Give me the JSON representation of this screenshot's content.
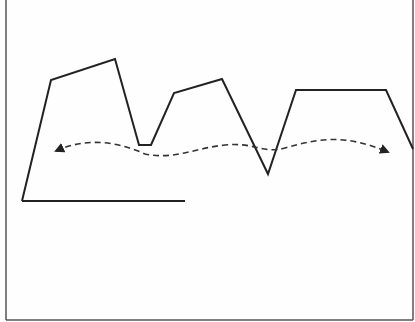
{
  "diagram": {
    "frame": {
      "stroke": "#555555"
    },
    "solid_line": {
      "stroke": "#222222",
      "points": [
        [
          22,
          201
        ],
        [
          51,
          80
        ],
        [
          115,
          59
        ],
        [
          139,
          145
        ],
        [
          151,
          145
        ],
        [
          174,
          93
        ],
        [
          222,
          79
        ],
        [
          268,
          174
        ],
        [
          296,
          90
        ],
        [
          386,
          90
        ],
        [
          413,
          149
        ]
      ]
    },
    "baseline": {
      "stroke": "#222222",
      "from": [
        22,
        201
      ],
      "to": [
        185,
        201
      ]
    },
    "dashed_arrow": {
      "stroke": "#333333",
      "path": "M56,151 C80,140 110,138 145,154 C175,160 195,148 225,145 C255,142 262,154 285,148 C320,138 345,134 388,152",
      "start_arrowhead": "triangle",
      "end_arrowhead": "triangle"
    }
  }
}
